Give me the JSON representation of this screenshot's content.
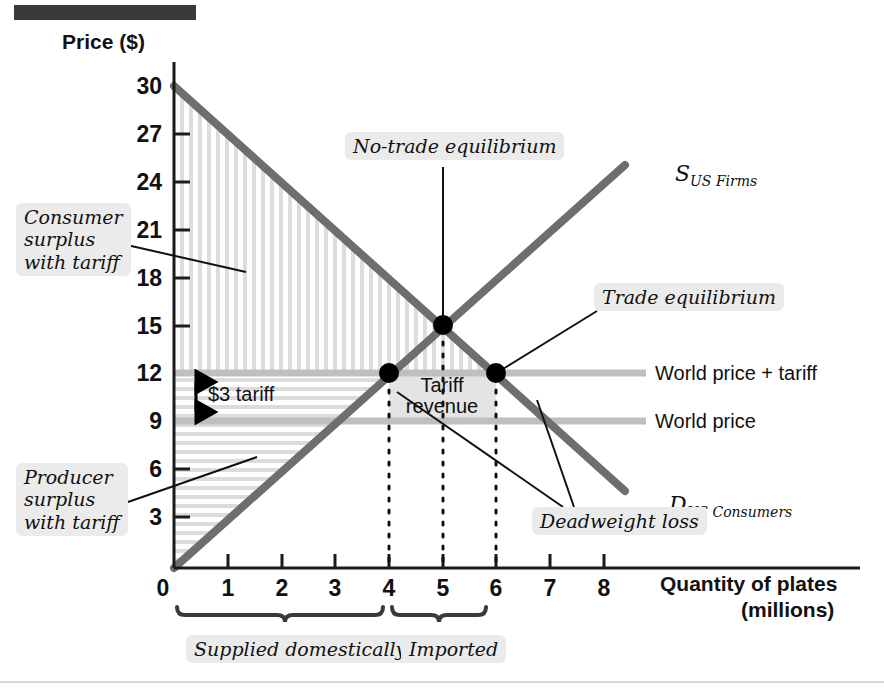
{
  "figure": {
    "title_bar": "",
    "y_axis": {
      "label": "Price ($)",
      "ticks": [
        "30",
        "27",
        "24",
        "21",
        "18",
        "15",
        "12",
        "9",
        "6",
        "3"
      ],
      "origin_label": "0"
    },
    "x_axis": {
      "label_line1": "Quantity of plates",
      "label_line2": "(millions)",
      "ticks": [
        "1",
        "2",
        "3",
        "4",
        "5",
        "6",
        "7",
        "8"
      ]
    },
    "curves": {
      "supply_label_main": "S",
      "supply_label_sub": "US Firms",
      "demand_label_main": "D",
      "demand_label_sub": "US Consumers"
    },
    "price_lines": {
      "world_price_plus_tariff": "World price + tariff",
      "world_price": "World price"
    },
    "annotations": {
      "consumer_surplus": "Consumer\nsurplus\nwith tariff",
      "producer_surplus": "Producer\nsurplus\nwith tariff",
      "no_trade_equilibrium": "No-trade equilibrium",
      "trade_equilibrium": "Trade equilibrium",
      "deadweight_loss": "Deadweight loss",
      "tariff_revenue": "Tariff\nrevenue",
      "tariff_arrow": "$3 tariff"
    },
    "braces": {
      "supplied_domestically": "Supplied domestically",
      "imported": "Imported"
    },
    "colors": {
      "curve": "#6e6e6e",
      "world_price_line": "#bdbdbd",
      "tariff_revenue_fill": "#e3e3e3",
      "hatch": "#d9d9d9",
      "point": "#000000",
      "callout_bg": "#ebebeb",
      "top_bar": "#3a3a3a"
    }
  },
  "chart_data": {
    "type": "line",
    "xlabel": "Quantity of plates (millions)",
    "ylabel": "Price ($)",
    "xlim": [
      0,
      8.8
    ],
    "ylim": [
      0,
      31
    ],
    "xticks": [
      1,
      2,
      3,
      4,
      5,
      6,
      7,
      8
    ],
    "yticks": [
      3,
      6,
      9,
      12,
      15,
      18,
      21,
      24,
      27,
      30
    ],
    "grid": false,
    "legend": "inline-curve-labels",
    "series": [
      {
        "name": "D US Consumers",
        "type": "line",
        "x": [
          0,
          8.4
        ],
        "y": [
          30,
          4.8
        ],
        "note": "Demand: P = 30 - 3Q"
      },
      {
        "name": "S US Firms",
        "type": "line",
        "x": [
          0,
          8.4
        ],
        "y": [
          0,
          25.2
        ],
        "note": "Supply: P = 3Q"
      },
      {
        "name": "World price",
        "type": "hline",
        "y": 9,
        "x": [
          0,
          8.0
        ]
      },
      {
        "name": "World price + tariff",
        "type": "hline",
        "y": 12,
        "x": [
          0,
          8.0
        ]
      }
    ],
    "points": [
      {
        "label": "No-trade equilibrium",
        "x": 5,
        "y": 15
      },
      {
        "label": "Domestic supply with tariff",
        "x": 4,
        "y": 12
      },
      {
        "label": "Trade equilibrium",
        "x": 6,
        "y": 12
      }
    ],
    "regions": [
      {
        "name": "Consumer surplus with tariff",
        "hatch": "vertical",
        "vertices": [
          [
            0,
            12
          ],
          [
            0,
            30
          ],
          [
            6,
            12
          ]
        ]
      },
      {
        "name": "Producer surplus with tariff",
        "hatch": "horizontal",
        "vertices": [
          [
            0,
            0
          ],
          [
            0,
            12
          ],
          [
            4,
            12
          ]
        ]
      },
      {
        "name": "Tariff revenue",
        "fill": "#e3e3e3",
        "vertices": [
          [
            4,
            9
          ],
          [
            6,
            9
          ],
          [
            6,
            12
          ],
          [
            4,
            12
          ]
        ]
      }
    ],
    "annotations": [
      {
        "text": "$3 tariff",
        "y_from": 9,
        "y_to": 12,
        "x": 0.4
      },
      {
        "text": "Deadweight loss",
        "points": [
          [
            4,
            9
          ],
          [
            6,
            9
          ]
        ]
      },
      {
        "text": "Supplied domestically",
        "x_range": [
          0,
          4
        ]
      },
      {
        "text": "Imported",
        "x_range": [
          4,
          6
        ]
      }
    ],
    "world_price": 9,
    "tariff": 3,
    "world_price_plus_tariff": 12,
    "no_trade_price": 15,
    "no_trade_quantity": 5,
    "quantity_supplied_domestically": 4,
    "quantity_demanded_with_tariff": 6,
    "quantity_imported": 2
  }
}
